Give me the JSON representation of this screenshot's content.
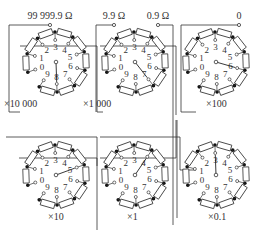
{
  "diagram": {
    "terminals": [
      {
        "label": "99 999.9 Ω",
        "x": 50,
        "y": 25
      },
      {
        "label": "9.9 Ω",
        "x": 114,
        "y": 25
      },
      {
        "label": "0.9 Ω",
        "x": 158,
        "y": 25
      },
      {
        "label": "0",
        "x": 239,
        "y": 25
      }
    ],
    "dials": [
      {
        "multiplier": "×10 000",
        "setting": 8,
        "cx": 56,
        "cy": 62
      },
      {
        "multiplier": "×1 000",
        "setting": 7,
        "cx": 135,
        "cy": 62
      },
      {
        "multiplier": "×100",
        "setting": 6,
        "cx": 216,
        "cy": 62
      },
      {
        "multiplier": "×10",
        "setting": 5,
        "cx": 56,
        "cy": 175
      },
      {
        "multiplier": "×1",
        "setting": 4,
        "cx": 135,
        "cy": 175
      },
      {
        "multiplier": "×0.1",
        "setting": 3,
        "cx": 216,
        "cy": 175
      }
    ],
    "dial_digits": [
      "0",
      "1",
      "2",
      "3",
      "4",
      "5",
      "6",
      "7",
      "8",
      "9"
    ],
    "colors": {
      "line": "#333333",
      "background": "#ffffff"
    }
  }
}
